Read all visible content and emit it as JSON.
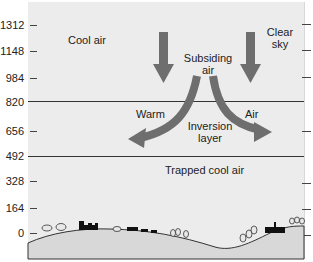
{
  "diagram": {
    "y_axis": {
      "ticks": [
        "1312",
        "1148",
        "984",
        "820",
        "656",
        "492",
        "328",
        "164",
        "0"
      ]
    },
    "labels": {
      "cool_air": "Cool air",
      "clear_sky_line1": "Clear",
      "clear_sky_line2": "sky",
      "subsiding_line1": "Subsiding",
      "subsiding_line2": "air",
      "warm": "Warm",
      "air": "Air",
      "inversion_line1": "Inversion",
      "inversion_line2": "layer",
      "trapped": "Trapped cool air"
    },
    "colors": {
      "background": "#ececec",
      "arrow": "#6e6e6e",
      "ground": "#dcdcdc",
      "lines": "#333333"
    }
  }
}
